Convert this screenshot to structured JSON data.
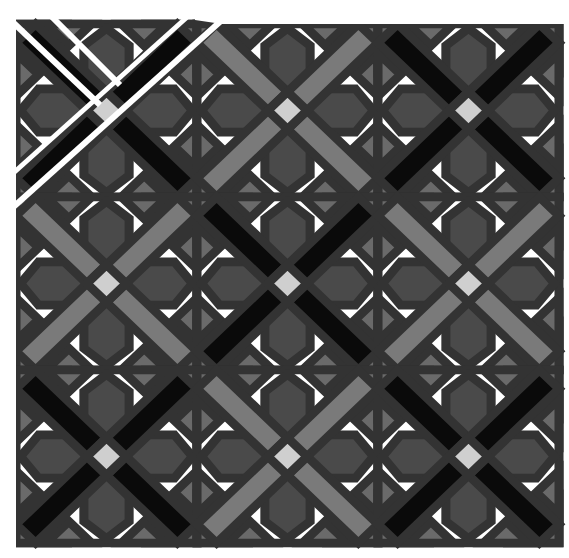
{
  "canvas": {
    "width": 569,
    "height": 558,
    "background": "#ffffff"
  },
  "grid": {
    "origin_x": 16,
    "origin_y": 24,
    "block_w": 181,
    "block_h": 173,
    "rows": 3,
    "cols": 3
  },
  "colors": {
    "black": "#0a0a0a",
    "medium_gray": "#7a7a7a",
    "dark_gray": "#4a4a4a",
    "side_gray": "#6a6a6a",
    "center_light": "#cfcfcf",
    "white": "#ffffff",
    "seam": "#333333"
  },
  "blocks": [
    {
      "row": 0,
      "col": 0,
      "band": "black",
      "exploded": true
    },
    {
      "row": 0,
      "col": 1,
      "band": "medium_gray",
      "exploded": false
    },
    {
      "row": 0,
      "col": 2,
      "band": "black",
      "exploded": false
    },
    {
      "row": 1,
      "col": 0,
      "band": "medium_gray",
      "exploded": false
    },
    {
      "row": 1,
      "col": 1,
      "band": "black",
      "exploded": false
    },
    {
      "row": 1,
      "col": 2,
      "band": "medium_gray",
      "exploded": false
    },
    {
      "row": 2,
      "col": 0,
      "band": "black",
      "exploded": false
    },
    {
      "row": 2,
      "col": 1,
      "band": "medium_gray",
      "exploded": false
    },
    {
      "row": 2,
      "col": 2,
      "band": "black",
      "exploded": false
    }
  ]
}
